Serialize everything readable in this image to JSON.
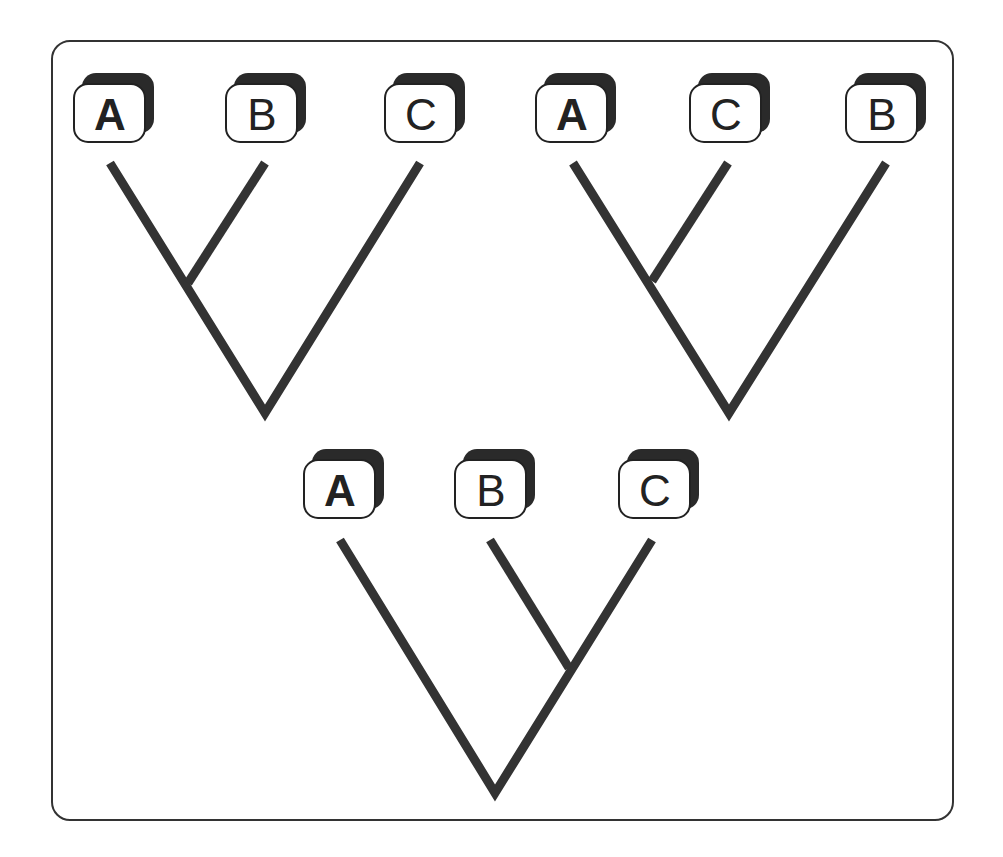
{
  "diagram": {
    "type": "phylogenetic-trees",
    "colors": {
      "line": "#333333",
      "box_shadow": "#2a2a2a",
      "background": "#ffffff"
    },
    "trees": [
      {
        "name": "tree-1",
        "taxa": [
          {
            "label": "A",
            "bold": true,
            "x": 110
          },
          {
            "label": "B",
            "bold": false,
            "x": 262
          },
          {
            "label": "C",
            "bold": false,
            "x": 421
          }
        ],
        "grouping": "((A,B),C)"
      },
      {
        "name": "tree-2",
        "taxa": [
          {
            "label": "A",
            "bold": true,
            "x": 572
          },
          {
            "label": "C",
            "bold": false,
            "x": 726
          },
          {
            "label": "B",
            "bold": false,
            "x": 882
          }
        ],
        "grouping": "((A,C),B)"
      },
      {
        "name": "tree-3",
        "taxa": [
          {
            "label": "A",
            "bold": true,
            "x": 340
          },
          {
            "label": "B",
            "bold": false,
            "x": 491
          },
          {
            "label": "C",
            "bold": false,
            "x": 655
          }
        ],
        "grouping": "(A,(B,C))"
      }
    ]
  }
}
